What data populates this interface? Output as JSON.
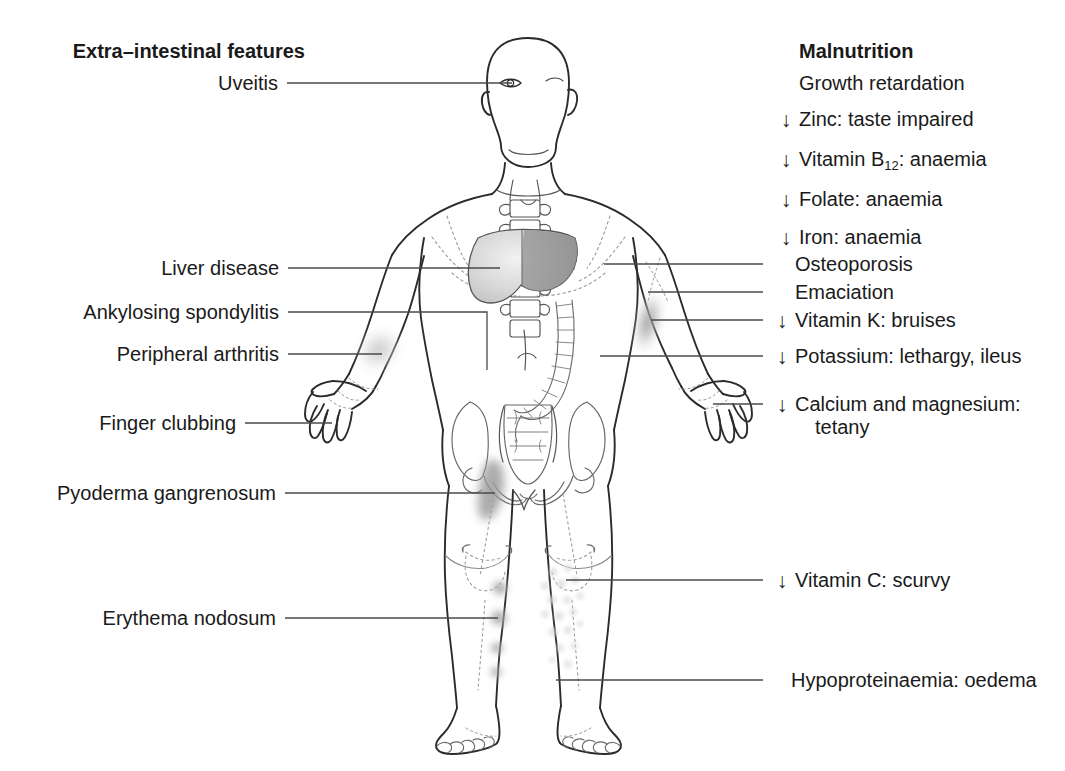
{
  "figure": {
    "title_left": "Extra–intestinal features",
    "title_right": "Malnutrition",
    "decrease_arrow": "↓"
  },
  "left_labels": [
    {
      "id": "uveitis",
      "text": "Uveitis",
      "target": "eye"
    },
    {
      "id": "liver-disease",
      "text": "Liver disease",
      "target": "liver"
    },
    {
      "id": "ankylosing-spondylitis",
      "text": "Ankylosing spondylitis",
      "target": "sacroiliac-joint"
    },
    {
      "id": "peripheral-arthritis",
      "text": "Peripheral arthritis",
      "target": "wrist"
    },
    {
      "id": "finger-clubbing",
      "text": "Finger clubbing",
      "target": "fingers"
    },
    {
      "id": "pyoderma-gangrenosum",
      "text": "Pyoderma gangrenosum",
      "target": "thigh-lesion"
    },
    {
      "id": "erythema-nodosum",
      "text": "Erythema nodosum",
      "target": "shin-nodules"
    }
  ],
  "right_labels": [
    {
      "id": "growth-retardation",
      "arrow": false,
      "text": "Growth retardation"
    },
    {
      "id": "zinc",
      "arrow": true,
      "text": "Zinc: taste impaired"
    },
    {
      "id": "vitamin-b12",
      "arrow": true,
      "text": "Vitamin B",
      "sub": "12",
      "text_after": ": anaemia"
    },
    {
      "id": "folate",
      "arrow": true,
      "text": "Folate: anaemia"
    },
    {
      "id": "iron",
      "arrow": true,
      "text": "Iron: anaemia"
    },
    {
      "id": "osteoporosis",
      "arrow": false,
      "text": "Osteoporosis"
    },
    {
      "id": "emaciation",
      "arrow": false,
      "text": "Emaciation"
    },
    {
      "id": "vitamin-k",
      "arrow": true,
      "text": "Vitamin K: bruises"
    },
    {
      "id": "potassium",
      "arrow": true,
      "text": "Potassium: lethargy, ileus"
    },
    {
      "id": "calcium-magnesium",
      "arrow": true,
      "text": "Calcium and magnesium:",
      "line2": "tetany"
    },
    {
      "id": "vitamin-c",
      "arrow": true,
      "text": "Vitamin C: scurvy"
    },
    {
      "id": "hypoproteinaemia",
      "arrow": false,
      "text": "Hypoproteinaemia: oedema"
    }
  ],
  "colors": {
    "ink": "#1a1a1a",
    "outline": "#2b2b2b",
    "leader": "#4a4a4a",
    "dotted": "#9a9a9a",
    "shade_light": "#cfcfcf",
    "shade_mid": "#a8a8a8",
    "shade_dark": "#8a8a8a",
    "organ_fill": "#d9d9d9"
  }
}
